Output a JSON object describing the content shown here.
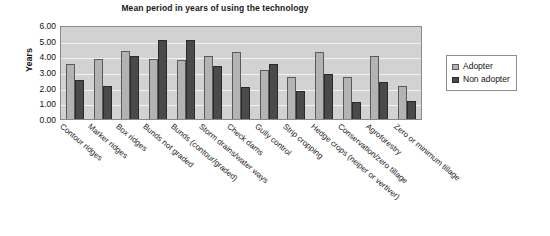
{
  "chart_data": {
    "type": "bar",
    "title": "Mean period in years of using the technology",
    "xlabel": "",
    "ylabel": "Years",
    "ylim": [
      0,
      6
    ],
    "ytick_labels": [
      "6.00",
      "5.00",
      "4.00",
      "3.00",
      "2.00",
      "1.00",
      "0.00"
    ],
    "ytick_values": [
      6,
      5,
      4,
      3,
      2,
      1,
      0
    ],
    "grid": true,
    "legend_position": "right",
    "categories": [
      "Contour ridges",
      "Marker ridges",
      "Box ridges",
      "Bunds not graded",
      "Bunds (contour/graded)",
      "Storm drains/water ways",
      "Check dams",
      "Gully control",
      "Strip cropping",
      "Hedge crops (neiper or vertiver)",
      "Conservation/zero tillage",
      "Agroforestry",
      "Zero or minimum tillage"
    ],
    "series": [
      {
        "name": "Adopter",
        "color": "#b3b3b3",
        "values": [
          3.52,
          3.85,
          4.35,
          3.86,
          3.78,
          4.0,
          4.25,
          3.15,
          2.66,
          4.25,
          2.65,
          4.05,
          2.1
        ]
      },
      {
        "name": "Non adopter",
        "color": "#4a4a4a",
        "values": [
          2.46,
          2.12,
          4.0,
          5.05,
          5.05,
          3.36,
          2.05,
          3.52,
          1.76,
          2.9,
          1.1,
          2.38,
          1.12
        ]
      }
    ]
  },
  "legend": {
    "items": [
      {
        "label": "Adopter"
      },
      {
        "label": "Non adopter"
      }
    ]
  }
}
